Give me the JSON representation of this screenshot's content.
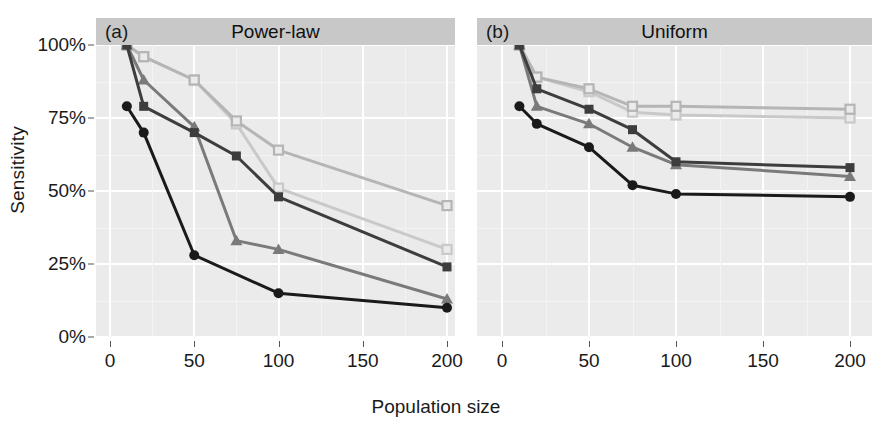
{
  "axes": {
    "y_title": "Sensitivity",
    "x_title": "Population size",
    "y_ticks": [
      "0%",
      "25%",
      "50%",
      "75%",
      "100%"
    ],
    "x_ticks": [
      "0",
      "50",
      "100",
      "150",
      "200"
    ]
  },
  "panels": [
    {
      "tag": "(a)",
      "title": "Power-law"
    },
    {
      "tag": "(b)",
      "title": "Uniform"
    }
  ],
  "colors": {
    "series_black_circle": "#1a1a1a",
    "series_dark_square": "#3d3d3d",
    "series_gray_triangle": "#7a7a7a",
    "series_light_square": "#b5b5b5",
    "series_lighter_square": "#c9c9c9",
    "panel_background": "#ebebeb",
    "strip_background": "#c8c8c8",
    "gridline": "#ffffff"
  },
  "chart_data": {
    "type": "line",
    "title": "",
    "xlabel": "Population size",
    "ylabel": "Sensitivity",
    "xlim": [
      0,
      210
    ],
    "ylim": [
      0,
      100
    ],
    "y_tick_values": [
      0,
      25,
      50,
      75,
      100
    ],
    "x_tick_values": [
      0,
      50,
      100,
      150,
      200
    ],
    "grid": true,
    "legend": "none",
    "panels": [
      {
        "tag": "(a)",
        "title": "Power-law",
        "series": [
          {
            "name": "black-circle",
            "marker": "filled-circle",
            "color": "#1a1a1a",
            "x": [
              10,
              20,
              50,
              100,
              200
            ],
            "values": [
              79,
              70,
              28,
              15,
              10
            ]
          },
          {
            "name": "dark-square",
            "marker": "filled-square",
            "color": "#3d3d3d",
            "x": [
              10,
              20,
              50,
              75,
              100,
              200
            ],
            "values": [
              100,
              79,
              70,
              62,
              48,
              24
            ]
          },
          {
            "name": "gray-triangle",
            "marker": "filled-triangle",
            "color": "#7a7a7a",
            "x": [
              10,
              20,
              50,
              75,
              100,
              200
            ],
            "values": [
              100,
              88,
              72,
              33,
              30,
              13
            ]
          },
          {
            "name": "light-open-square",
            "marker": "open-square",
            "color": "#b5b5b5",
            "x": [
              10,
              20,
              50,
              75,
              100,
              200
            ],
            "values": [
              100,
              96,
              88,
              74,
              64,
              45
            ]
          },
          {
            "name": "lighter-open-square",
            "marker": "open-square",
            "color": "#c9c9c9",
            "x": [
              10,
              20,
              50,
              75,
              100,
              200
            ],
            "values": [
              100,
              96,
              88,
              73,
              51,
              30
            ]
          }
        ]
      },
      {
        "tag": "(b)",
        "title": "Uniform",
        "series": [
          {
            "name": "black-circle",
            "marker": "filled-circle",
            "color": "#1a1a1a",
            "x": [
              10,
              20,
              50,
              75,
              100,
              200
            ],
            "values": [
              79,
              73,
              65,
              52,
              49,
              48
            ]
          },
          {
            "name": "dark-square",
            "marker": "filled-square",
            "color": "#3d3d3d",
            "x": [
              10,
              20,
              50,
              75,
              100,
              200
            ],
            "values": [
              100,
              85,
              78,
              71,
              60,
              58
            ]
          },
          {
            "name": "gray-triangle",
            "marker": "filled-triangle",
            "color": "#7a7a7a",
            "x": [
              10,
              20,
              50,
              75,
              100,
              200
            ],
            "values": [
              100,
              79,
              73,
              65,
              59,
              55
            ]
          },
          {
            "name": "light-open-square",
            "marker": "open-square",
            "color": "#b5b5b5",
            "x": [
              10,
              20,
              50,
              75,
              100,
              200
            ],
            "values": [
              100,
              89,
              85,
              79,
              79,
              78
            ]
          },
          {
            "name": "lighter-open-square",
            "marker": "open-square",
            "color": "#c9c9c9",
            "x": [
              10,
              20,
              50,
              75,
              100,
              200
            ],
            "values": [
              100,
              89,
              84,
              77,
              76,
              75
            ]
          }
        ]
      }
    ]
  }
}
